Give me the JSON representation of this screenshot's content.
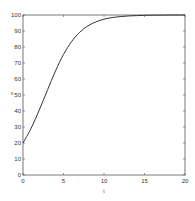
{
  "chart_data": {
    "type": "line",
    "title": "",
    "xlabel": "t",
    "ylabel": "x",
    "xlim": [
      0,
      20
    ],
    "ylim": [
      0,
      100
    ],
    "xticks": [
      0,
      5,
      10,
      15,
      20
    ],
    "yticks": [
      0,
      10,
      20,
      30,
      40,
      50,
      60,
      70,
      80,
      90,
      100
    ],
    "grid": false,
    "legend": null,
    "series": [
      {
        "name": "x(t)",
        "x": [
          0,
          1,
          2,
          3,
          4,
          5,
          6,
          7,
          8,
          9,
          10,
          11,
          12,
          13,
          14,
          15,
          16,
          17,
          18,
          19,
          20
        ],
        "values": [
          20,
          29.2,
          40.5,
          52.8,
          64.9,
          75.3,
          83.4,
          89.2,
          93.2,
          95.7,
          97.4,
          98.4,
          99.0,
          99.4,
          99.6,
          99.8,
          99.9,
          99.9,
          100,
          100,
          100
        ],
        "color": "#333333"
      }
    ]
  }
}
